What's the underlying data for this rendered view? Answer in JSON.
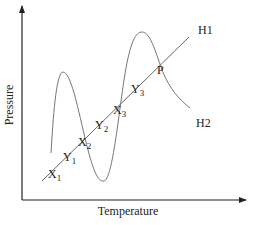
{
  "diagram": {
    "x_axis_label": "Temperature",
    "y_axis_label": "Pressure",
    "line_label": "H1",
    "curve_label": "H2",
    "intersection_label": "P",
    "points": [
      {
        "base": "X",
        "sub": "1"
      },
      {
        "base": "Y",
        "sub": "1"
      },
      {
        "base": "X",
        "sub": "2"
      },
      {
        "base": "Y",
        "sub": "2"
      },
      {
        "base": "X",
        "sub": "3"
      },
      {
        "base": "Y",
        "sub": "3"
      }
    ],
    "colors": {
      "axis": "#222222",
      "line": "#666666",
      "curve": "#777777",
      "text": "#222222"
    }
  }
}
